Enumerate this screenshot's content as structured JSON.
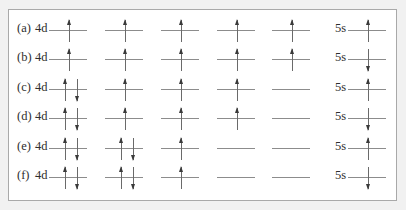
{
  "rows": [
    {
      "label": "(a)",
      "subshell_d": "4d",
      "d_orbitals": [
        "up",
        "up",
        "up",
        "up",
        "up"
      ],
      "subshell_s": "5s",
      "s_orbital": [
        "up"
      ]
    },
    {
      "label": "(b)",
      "subshell_d": "4d",
      "d_orbitals": [
        "up",
        "up",
        "up",
        "up",
        "up"
      ],
      "subshell_s": "5s",
      "s_orbital": [
        "down"
      ]
    },
    {
      "label": "(c)",
      "subshell_d": "4d",
      "d_orbitals": [
        "pair",
        "up",
        "up",
        "up",
        "empty"
      ],
      "subshell_s": "5s",
      "s_orbital": [
        "up"
      ]
    },
    {
      "label": "(d)",
      "subshell_d": "4d",
      "d_orbitals": [
        "pair",
        "up",
        "up",
        "up",
        "empty"
      ],
      "subshell_s": "5s",
      "s_orbital": [
        "down"
      ]
    },
    {
      "label": "(e)",
      "subshell_d": "4d",
      "d_orbitals": [
        "pair",
        "pair",
        "up",
        "empty",
        "empty"
      ],
      "subshell_s": "5s",
      "s_orbital": [
        "up"
      ]
    },
    {
      "label": "(f)",
      "subshell_d": "4d",
      "d_orbitals": [
        "pair",
        "pair",
        "up",
        "empty",
        "empty"
      ],
      "subshell_s": "5s",
      "s_orbital": [
        "down"
      ]
    }
  ],
  "legend": {
    "up": "single electron, spin up",
    "down": "single electron, spin down",
    "pair": "paired electrons (up + down)",
    "empty": "empty orbital"
  },
  "colors": {
    "background": "#f1f1f1",
    "frame": "#ffffff",
    "frame_border": "#a9a9a9",
    "orbital_line": "#8c8c8c",
    "arrow": "#3a3a3a",
    "text": "#2e2e2e"
  }
}
